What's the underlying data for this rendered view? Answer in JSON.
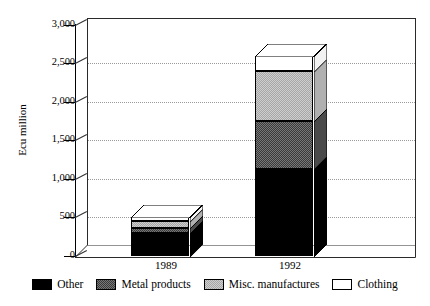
{
  "chart_data": {
    "type": "bar",
    "stacked": true,
    "three_d": true,
    "title": "",
    "xlabel": "",
    "ylabel": "Ecu million",
    "ylim": [
      0,
      3000
    ],
    "ytick_step": 500,
    "ytick_labels": [
      "3,000",
      "2,500",
      "2,000",
      "1,500",
      "1,000",
      "500",
      "0"
    ],
    "ytick_values": [
      3000,
      2500,
      2000,
      1500,
      1000,
      500,
      0
    ],
    "grid": "horizontal-dotted",
    "legend_position": "bottom",
    "categories": [
      "1989",
      "1992"
    ],
    "series": [
      {
        "name": "Other",
        "color": "#000000",
        "values": [
          300,
          1130
        ]
      },
      {
        "name": "Metal products",
        "color": "#4a4a4a",
        "values": [
          65,
          620
        ]
      },
      {
        "name": "Misc. manufactures",
        "color": "#bdbdbd",
        "values": [
          90,
          650
        ]
      },
      {
        "name": "Clothing",
        "color": "#ffffff",
        "values": [
          55,
          200
        ]
      }
    ],
    "totals": [
      510,
      2600
    ]
  },
  "axis": {
    "y_title": "Ecu million"
  },
  "legend": {
    "items": [
      {
        "label": "Other",
        "swatch": "swatch-other"
      },
      {
        "label": "Metal products",
        "swatch": "swatch-metal"
      },
      {
        "label": "Misc. manufactures",
        "swatch": "swatch-misc"
      },
      {
        "label": "Clothing",
        "swatch": "swatch-clothing"
      }
    ]
  }
}
